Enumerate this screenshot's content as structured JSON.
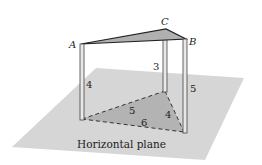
{
  "diagram": {
    "points": [
      {
        "name": "A",
        "label": "A"
      },
      {
        "name": "B",
        "label": "B"
      },
      {
        "name": "C",
        "label": "C"
      }
    ],
    "pillar_heights": {
      "A": "4",
      "C": "3",
      "B": "5"
    },
    "base_edges": {
      "AC": "5",
      "CB": "4",
      "AB": "6"
    },
    "plane_label": "Horizontal plane",
    "colors": {
      "plane": "#d4d4d4",
      "triangle": "#aaaaaa",
      "pillar": "#555555"
    }
  }
}
